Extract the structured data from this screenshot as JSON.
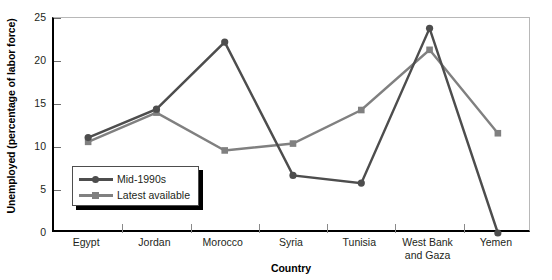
{
  "chart_data": {
    "type": "line",
    "title": "",
    "xlabel": "Country",
    "ylabel": "Unemployed (percentage of labor force)",
    "categories": [
      "Egypt",
      "Jordan",
      "Morocco",
      "Syria",
      "Tunisia",
      "West Bank\nand Gaza",
      "Yemen"
    ],
    "ylim": [
      0,
      25
    ],
    "yticks": [
      0,
      5,
      10,
      15,
      20,
      25
    ],
    "grid": false,
    "legend_position": "inside-lower-left",
    "series": [
      {
        "name": "Mid-1990s",
        "color": "#4d4d4d",
        "marker": "circle",
        "values": [
          11.1,
          14.4,
          22.2,
          6.7,
          5.8,
          23.8,
          0.0
        ]
      },
      {
        "name": "Latest available",
        "color": "#808080",
        "marker": "square",
        "values": [
          10.6,
          14.0,
          9.6,
          10.4,
          14.3,
          21.3,
          11.6
        ]
      }
    ]
  },
  "axis": {
    "y_tick_labels": [
      "25",
      "20",
      "15",
      "10",
      "5",
      "0"
    ],
    "y_title": "Unemployed (percentage of labor force)",
    "x_title": "Country"
  },
  "legend": {
    "items": [
      {
        "label": "Mid-1990s",
        "color": "#4d4d4d",
        "marker": "circle"
      },
      {
        "label": "Latest available",
        "color": "#808080",
        "marker": "square"
      }
    ]
  },
  "colors": {
    "series_mid1990s": "#4d4d4d",
    "series_latest": "#808080",
    "axis": "#000000",
    "frame_light": "#b8b8b8",
    "text": "#231f20",
    "background": "#ffffff"
  }
}
